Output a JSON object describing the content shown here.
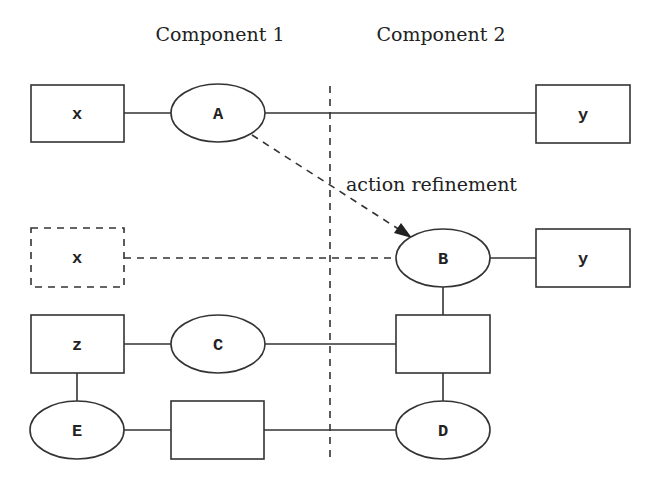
{
  "headers": {
    "component1": "Component 1",
    "component2": "Component 2"
  },
  "annotation": {
    "arrow_label": "action refinement"
  },
  "nodes": {
    "row1": {
      "left_box": "x",
      "ellipse": "A",
      "right_box": "y"
    },
    "row2": {
      "left_box_dashed": "x",
      "ellipse": "B",
      "right_box": "y"
    },
    "row3": {
      "left_box": "z",
      "ellipse": "C",
      "right_box": ""
    },
    "row4": {
      "ellipse_left": "E",
      "box": "",
      "ellipse_right": "D"
    }
  }
}
